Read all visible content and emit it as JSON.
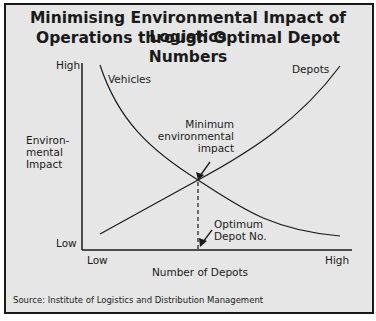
{
  "title": {
    "line1": "Minimising Environmental Impact of Logistics",
    "line2": "Operations through Optimal Depot Numbers"
  },
  "y_axis": {
    "label_line1": "Environ-",
    "label_line2": "mental",
    "label_line3": "Impact",
    "high": "High",
    "low": "Low"
  },
  "x_axis": {
    "label": "Number of Depots",
    "low": "Low",
    "high": "High"
  },
  "curves": {
    "vehicles": "Vehicles",
    "depots": "Depots"
  },
  "annotations": {
    "minimum_line1": "Minimum",
    "minimum_line2": "environmental",
    "minimum_line3": "impact",
    "optimum_line1": "Optimum",
    "optimum_line2": "Depot No."
  },
  "source": "Source: Institute of Logistics and Distribution Management",
  "colors": {
    "background": "#e6e6e6",
    "line": "#1a1a1a"
  }
}
